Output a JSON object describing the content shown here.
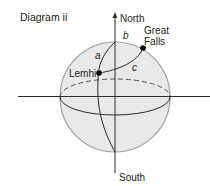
{
  "diagram": {
    "title": "Diagram ii",
    "axis": {
      "north_label": "North",
      "south_label": "South"
    },
    "points": [
      {
        "id": "lemhi",
        "label": "Lemhi"
      },
      {
        "id": "great_falls",
        "label_line1": "Great",
        "label_line2": "Falls"
      }
    ],
    "arcs": [
      {
        "id": "a",
        "label": "a"
      },
      {
        "id": "b",
        "label": "b"
      },
      {
        "id": "c",
        "label": "c"
      }
    ],
    "colors": {
      "sphere_fill": "#e6e6e6",
      "sphere_outline": "#9a9a9a",
      "line": "#2b2b2b",
      "point": "#000000"
    }
  }
}
